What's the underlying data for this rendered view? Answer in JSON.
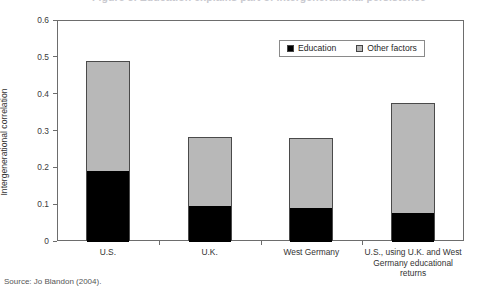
{
  "figure": {
    "cropped_title": "Figure 3. Education explains part of intergenerational persistence",
    "source_note": "Source: Jo Blandon (2004)."
  },
  "legend": {
    "position": "top-right-inside",
    "items": [
      {
        "label": "Education",
        "color": "#000000",
        "icon": "square-swatch-icon"
      },
      {
        "label": "Other factors",
        "color": "#b8b8b8",
        "icon": "square-swatch-icon"
      }
    ]
  },
  "chart_data": {
    "type": "bar",
    "stacked": true,
    "title": "",
    "xlabel": "",
    "ylabel": "Intergenerational correlation",
    "ylim": [
      0,
      0.6
    ],
    "yticks": [
      0,
      0.1,
      0.2,
      0.3,
      0.4,
      0.5,
      0.6
    ],
    "ytick_labels": [
      "0",
      "0.1",
      "0.2",
      "0.3",
      "0.4",
      "0.5",
      "0.6"
    ],
    "grid": false,
    "categories": [
      "U.S.",
      "U.K.",
      "West Germany",
      "U.S., using U.K. and West Germany educational returns"
    ],
    "category_label_lines": [
      [
        "U.S."
      ],
      [
        "U.K."
      ],
      [
        "West Germany"
      ],
      [
        "U.S., using U.K. and West",
        "Germany educational",
        "returns"
      ]
    ],
    "series": [
      {
        "name": "Education",
        "color": "#000000",
        "values": [
          0.193,
          0.098,
          0.093,
          0.079
        ]
      },
      {
        "name": "Other factors",
        "color": "#b8b8b8",
        "values": [
          0.297,
          0.184,
          0.187,
          0.296
        ]
      }
    ],
    "totals": [
      0.49,
      0.282,
      0.28,
      0.375
    ]
  }
}
